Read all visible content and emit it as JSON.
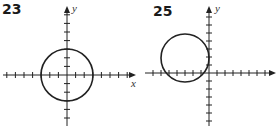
{
  "chart_data": [
    {
      "type": "line",
      "title": "23",
      "xlabel": "x",
      "ylabel": "y",
      "grid": false,
      "description": "Circle centered at origin with radius 3",
      "center": [
        0,
        0
      ],
      "radius": 3,
      "xlim": [
        -7,
        7
      ],
      "ylim": [
        -6,
        8
      ]
    },
    {
      "type": "line",
      "title": "25",
      "xlabel": "",
      "ylabel": "y",
      "grid": false,
      "description": "Circle centered at (-3, 2) with radius 3, tangent to the y-axis",
      "center": [
        -3,
        2
      ],
      "radius": 3,
      "xlim": [
        -7,
        7
      ],
      "ylim": [
        -6,
        8
      ]
    }
  ],
  "panels": [
    {
      "number": "23",
      "x_label": "x",
      "y_label": "y"
    },
    {
      "number": "25",
      "x_label": "",
      "y_label": "y"
    }
  ]
}
